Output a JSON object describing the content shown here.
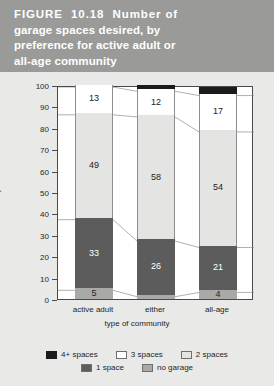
{
  "figure": {
    "title_lines": [
      "FIGURE  10.18  Number of",
      "garage spaces desired, by",
      "preference for active adult or",
      "all-age community"
    ],
    "banner_color": "#9a9a98"
  },
  "chart_data": {
    "type": "bar",
    "subtype": "stacked-100-percent",
    "title": "FIGURE 10.18 Number of garage spaces desired, by preference for active adult or all-age community",
    "xlabel": "type of community",
    "ylabel": "percent",
    "ylim": [
      0,
      100
    ],
    "ytick_step": 10,
    "yticks": [
      "100",
      "90",
      "80",
      "70",
      "60",
      "50",
      "40",
      "30",
      "20",
      "10",
      "0"
    ],
    "grid": false,
    "legend_position": "bottom",
    "categories": [
      "active adult",
      "either",
      "all-age"
    ],
    "series": [
      {
        "name": "no garage",
        "color": "#a9a9a7",
        "values": [
          5,
          2,
          4
        ]
      },
      {
        "name": "1 space",
        "color": "#5c5c5c",
        "values": [
          33,
          26,
          21
        ]
      },
      {
        "name": "2 spaces",
        "color": "#e4e4e2",
        "values": [
          49,
          58,
          54
        ]
      },
      {
        "name": "3 spaces",
        "color": "#ffffff",
        "values": [
          13,
          12,
          17
        ]
      },
      {
        "name": "4+ spaces",
        "color": "#1b1b1b",
        "values": [
          0,
          2,
          3
        ]
      }
    ],
    "stack_order_bottom_to_top": [
      "no garage",
      "1 space",
      "2 spaces",
      "3 spaces",
      "4+ spaces"
    ],
    "data_labels": {
      "active adult": {
        "no garage": "5",
        "1 space": "33",
        "2 spaces": "49",
        "3 spaces": "13",
        "4+ spaces": ""
      },
      "either": {
        "no garage": "2",
        "1 space": "26",
        "2 spaces": "58",
        "3 spaces": "12",
        "4+ spaces": ""
      },
      "all-age": {
        "no garage": "4",
        "1 space": "21",
        "2 spaces": "54",
        "3 spaces": "17",
        "4+ spaces": "3"
      }
    }
  },
  "legend": {
    "row1": [
      {
        "label": "4+ spaces",
        "color": "#1b1b1b"
      },
      {
        "label": "3 spaces",
        "color": "#ffffff"
      },
      {
        "label": "2 spaces",
        "color": "#e4e4e2"
      }
    ],
    "row2": [
      {
        "label": "1 space",
        "color": "#5c5c5c"
      },
      {
        "label": "no garage",
        "color": "#a9a9a7"
      }
    ]
  }
}
